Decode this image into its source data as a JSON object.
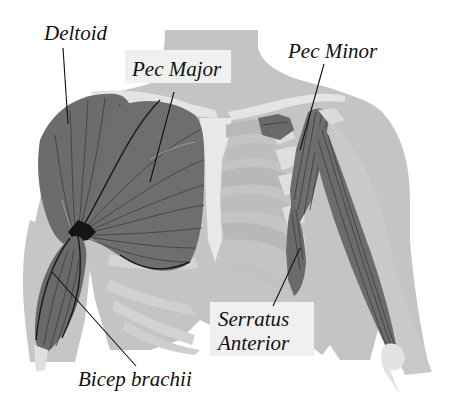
{
  "colors": {
    "background": "#ffffff",
    "body": "#c4c4c4",
    "body_light": "#d6d6d6",
    "bone": "#e6e6e6",
    "rib_shadow": "#bdbdbd",
    "muscle": "#6e6e6e",
    "muscle_dark": "#5a5a5a",
    "label_box": "#f0f0f0",
    "text": "#111111"
  },
  "labels": {
    "deltoid": "Deltoid",
    "pec_major": "Pec Major",
    "pec_minor": "Pec Minor",
    "serratus_line1": "Serratus",
    "serratus_line2": "Anterior",
    "bicep": "Bicep brachii"
  }
}
